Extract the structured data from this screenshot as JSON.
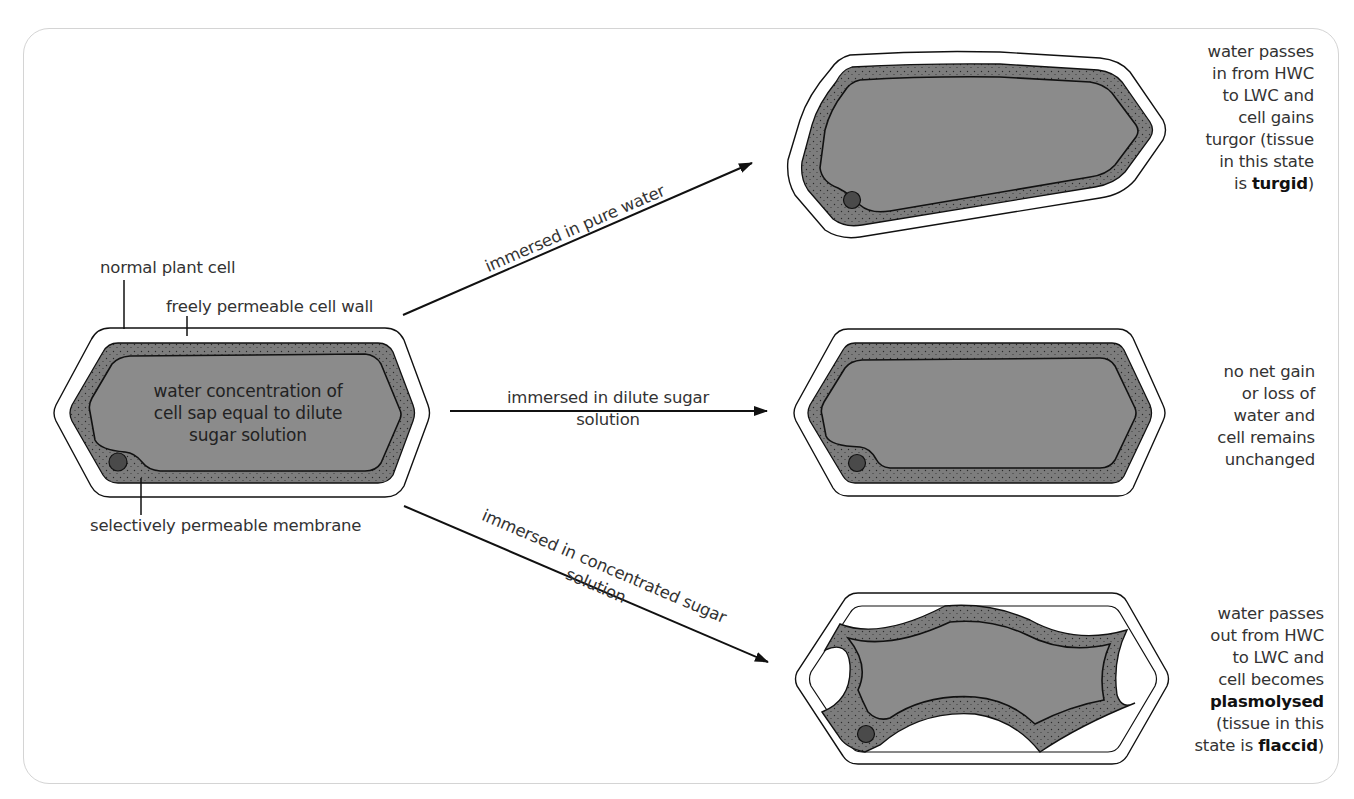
{
  "diagram": {
    "source_cell": {
      "labels": {
        "cell": "normal plant cell",
        "wall": "freely permeable cell wall",
        "membrane": "selectively permeable membrane"
      },
      "sap_text": "water concentration of\ncell sap equal to dilute\nsugar solution"
    },
    "arrows": [
      {
        "id": "pure-water",
        "label": "immersed in pure water"
      },
      {
        "id": "dilute",
        "label": "immersed in dilute sugar\nsolution"
      },
      {
        "id": "concentrated",
        "label": "immersed in concentrated sugar\nsolution"
      }
    ],
    "outcomes": [
      {
        "id": "turgid",
        "desc_pre": "water passes\nin from HWC\nto LWC and\ncell gains\nturgor (tissue\nin this state\nis ",
        "desc_bold": "turgid",
        "desc_post": ")"
      },
      {
        "id": "unchanged",
        "desc_pre": "no net gain\nor loss of\nwater and\ncell remains\nunchanged",
        "desc_bold": "",
        "desc_post": ""
      },
      {
        "id": "plasmolysed",
        "desc_pre": "water passes\nout from HWC\nto LWC and\ncell becomes\n",
        "desc_bold": "plasmolysed",
        "desc_mid": "\n(tissue in this\nstate is ",
        "desc_bold2": "flaccid",
        "desc_post": ")"
      }
    ],
    "colors": {
      "cytoplasm": "#7a7a7a",
      "vacuole": "#8c8c8c",
      "outline": "#1a1a1a",
      "frame": "#d4d4d4",
      "text": "#333333"
    }
  }
}
